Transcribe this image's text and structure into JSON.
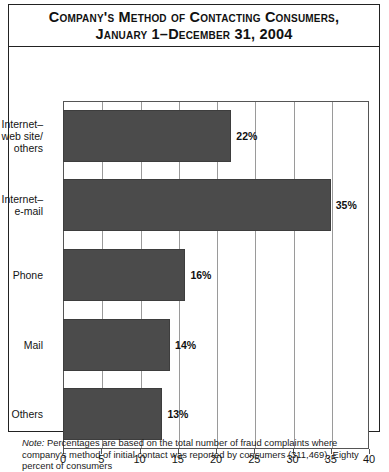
{
  "figure": {
    "title_line_1": "Company's Method of Contacting Consumers,",
    "title_line_2": "January 1–December 31, 2004",
    "note_label": "Note:",
    "note_text": " Percentages are based on the total number of fraud complaints where company's method of initial contact was reported by consumers (311,469). Eighty percent of consumers"
  },
  "colors": {
    "bar": "#4b4b4b",
    "bar_border": "#3d3d3d",
    "grid": "#9a9a9a",
    "axis": "#555555",
    "frame": "#222222",
    "text": "#141414"
  },
  "chart_data": {
    "type": "bar",
    "orientation": "horizontal",
    "title": "Company's Method of Contacting Consumers, January 1–December 31, 2004",
    "xlabel": "",
    "ylabel": "",
    "xlim": [
      0,
      40
    ],
    "xticks": [
      0,
      5,
      10,
      15,
      20,
      25,
      30,
      35,
      40
    ],
    "xtick_labels": [
      "0",
      "5",
      "10",
      "15",
      "20",
      "25",
      "30",
      "35",
      "40"
    ],
    "grid": true,
    "legend": false,
    "units": "percent",
    "categories": [
      "Internet–\nweb site/\nothers",
      "Internet–\ne-mail",
      "Phone",
      "Mail",
      "Others"
    ],
    "values": [
      22,
      35,
      16,
      14,
      13
    ],
    "value_labels": [
      "22%",
      "35%",
      "16%",
      "14%",
      "13%"
    ]
  }
}
